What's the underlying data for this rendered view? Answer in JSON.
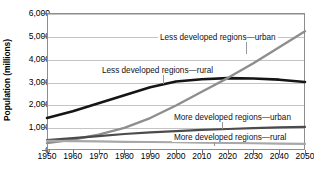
{
  "chart": {
    "title": "",
    "ylabel": "Population (millions)",
    "xlabel": ""
  },
  "axis": {
    "y_ticks": [
      "0",
      "1,000",
      "2,000",
      "3,000",
      "4,000",
      "5,000",
      "6,000"
    ],
    "x_ticks": [
      "1950",
      "1960",
      "1970",
      "1980",
      "1990",
      "2000",
      "2010",
      "2020",
      "2030",
      "2040",
      "2050"
    ]
  },
  "annotations": {
    "less_urban": "Less developed regions—urban",
    "less_rural": "Less developed regions—rural",
    "more_urban": "More developed regions—urban",
    "more_rural": "More developed regions—rural"
  },
  "colors": {
    "less_rural_line": "#151515",
    "less_urban_line": "#8e8e8e",
    "more_urban_line": "#4b4b4b",
    "more_rural_line": "#a8a8a8",
    "gridline": "#c4c4c4",
    "frame": "#8d8d8d",
    "text": "#111111"
  },
  "chart_data": {
    "type": "line",
    "title": "",
    "xlabel": "",
    "ylabel": "Population (millions)",
    "xlim": [
      1950,
      2050
    ],
    "ylim": [
      0,
      6000
    ],
    "xticks": [
      1950,
      1960,
      1970,
      1980,
      1990,
      2000,
      2010,
      2020,
      2030,
      2040,
      2050
    ],
    "yticks": [
      0,
      1000,
      2000,
      3000,
      4000,
      5000,
      6000
    ],
    "grid": "horizontal",
    "legend": "inline-annotations",
    "x": [
      1950,
      1960,
      1970,
      1980,
      1990,
      2000,
      2010,
      2020,
      2030,
      2040,
      2050
    ],
    "series": [
      {
        "name": "Less developed regions—rural",
        "color": "#151515",
        "values": [
          1400,
          1700,
          2050,
          2400,
          2750,
          3000,
          3100,
          3150,
          3130,
          3080,
          2980
        ]
      },
      {
        "name": "Less developed regions—urban",
        "color": "#8e8e8e",
        "values": [
          300,
          460,
          670,
          970,
          1400,
          1950,
          2550,
          3150,
          3800,
          4500,
          5200
        ]
      },
      {
        "name": "More developed regions—urban",
        "color": "#4b4b4b",
        "values": [
          430,
          520,
          610,
          700,
          770,
          830,
          880,
          920,
          960,
          990,
          1010
        ]
      },
      {
        "name": "More developed regions—rural",
        "color": "#a8a8a8",
        "values": [
          400,
          390,
          375,
          360,
          350,
          340,
          325,
          310,
          295,
          280,
          265
        ]
      }
    ]
  }
}
